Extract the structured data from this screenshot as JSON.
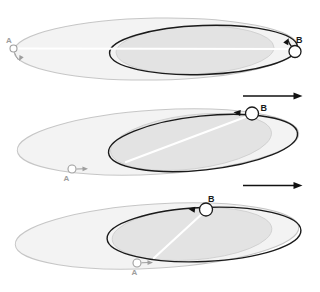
{
  "figure": {
    "description_labels": {
      "particle_a": "A",
      "particle_b": "B"
    },
    "panels": [
      {
        "id": "top",
        "particle_a_label": "A",
        "particle_b_label": "B"
      },
      {
        "id": "middle",
        "particle_a_label": "A",
        "particle_b_label": "B"
      },
      {
        "id": "bottom",
        "particle_a_label": "A",
        "particle_b_label": "B"
      }
    ],
    "colors": {
      "outer-fill": "#f3f3f3",
      "outer-stroke": "#c6c6c6",
      "shade-fill": "#e3e3e3",
      "shade-stroke": "#cccccc",
      "orbit-stroke": "#1a1a1a",
      "axis-line": "#ffffff",
      "gray": "#9e9e9e",
      "arrow": "#111111"
    }
  }
}
